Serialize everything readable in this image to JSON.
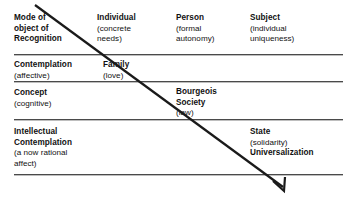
{
  "diagram": {
    "type": "matrix-table-with-diagonal-arrow",
    "rows": [
      {
        "id": "row-mode",
        "cells": [
          {
            "id": "mode-of-object-of-recognition",
            "bold_lines": [
              "Mode of",
              "object of",
              "Recognition"
            ],
            "plain_lines": []
          },
          {
            "id": "individual",
            "bold_lines": [
              "Individual"
            ],
            "plain_lines": [
              "(concrete",
              "needs)"
            ]
          },
          {
            "id": "person",
            "bold_lines": [
              "Person"
            ],
            "plain_lines": [
              "(formal",
              "autonomy)"
            ]
          },
          {
            "id": "subject",
            "bold_lines": [
              "Subject"
            ],
            "plain_lines": [
              "(individual",
              "uniqueness)"
            ]
          }
        ]
      },
      {
        "id": "row-contemplation",
        "cells": [
          {
            "id": "contemplation",
            "bold_lines": [
              "Contemplation"
            ],
            "plain_lines": [
              "(affective)"
            ]
          },
          {
            "id": "family",
            "bold_lines": [
              "Family"
            ],
            "plain_lines": [
              "(love)"
            ]
          }
        ]
      },
      {
        "id": "row-concept",
        "cells": [
          {
            "id": "concept",
            "bold_lines": [
              "Concept"
            ],
            "plain_lines": [
              "(cognitive)"
            ]
          },
          {
            "id": "bourgeois-society",
            "bold_lines": [
              "Bourgeois",
              "Society"
            ],
            "plain_lines": [
              "(law)"
            ]
          }
        ]
      },
      {
        "id": "row-intellectual-contemplation",
        "cells": [
          {
            "id": "intellectual-contemplation",
            "bold_lines": [
              "Intellectual",
              "Contemplation"
            ],
            "plain_lines": [
              "(a now rational",
              "affect)"
            ]
          },
          {
            "id": "state",
            "bold_lines": [
              "State"
            ],
            "plain_lines": [
              "(solidarity)"
            ],
            "bold_tail": [
              "Universalization"
            ]
          }
        ]
      }
    ]
  },
  "cells": {
    "mode": {
      "l1": "Mode of",
      "l2": "object of",
      "l3": "Recognition"
    },
    "individual": {
      "l1": "Individual",
      "l2": "(concrete",
      "l3": "needs)"
    },
    "person": {
      "l1": "Person",
      "l2": "(formal",
      "l3": "autonomy)"
    },
    "subject": {
      "l1": "Subject",
      "l2": "(individual",
      "l3": "uniqueness)"
    },
    "contemplation": {
      "l1": "Contemplation",
      "l2": "(affective)"
    },
    "family": {
      "l1": "Family",
      "l2": "(love)"
    },
    "concept": {
      "l1": "Concept",
      "l2": "(cognitive)"
    },
    "bourgeois": {
      "l1": "Bourgeois",
      "l2": "Society",
      "l3": "(law)"
    },
    "intellectual": {
      "l1": "Intellectual",
      "l2": "Contemplation",
      "l3": "(a now rational",
      "l4": "affect)"
    },
    "state": {
      "l1": "State",
      "l2": "(solidarity)",
      "l3": "Universalization"
    }
  },
  "colors": {
    "background": "#ffffff",
    "text": "#111111",
    "rule": "#4a4a4a",
    "arrow": "#1a1a1a"
  },
  "arrow": {
    "name": "diagonal-progression-arrow",
    "start_x": 35,
    "start_y": 5,
    "end_x": 283,
    "end_y": 189,
    "head": "down-right"
  }
}
